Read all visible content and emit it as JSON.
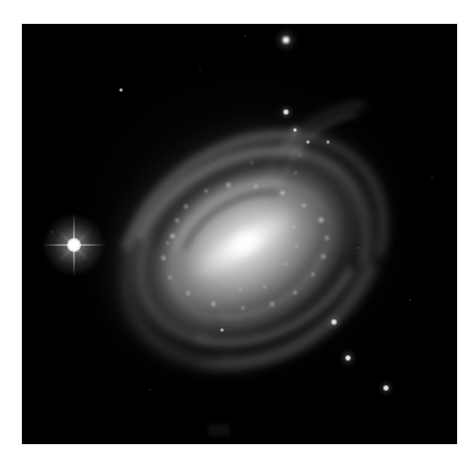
{
  "page": {
    "background_color": "#ffffff",
    "width": 473,
    "height": 463,
    "content_type": "astronomical-photograph"
  },
  "image_frame": {
    "name": "sky-image",
    "left": 22,
    "top": 24,
    "width": 435,
    "height": 420,
    "background_color": "#000000",
    "border_color": "#bfbfbf",
    "alt_text": "Grayscale telescope image of an inclined barred spiral galaxy on a black star field"
  },
  "galaxy": {
    "label": "spiral-galaxy",
    "center_x": 243,
    "center_y": 244,
    "position_angle_deg": -31,
    "nucleus_color": "#ffffff",
    "disk_color": "#9a9a9a",
    "dust_lane_color": "#000000",
    "components": [
      {
        "name": "nucleus",
        "brightness": "saturated-white"
      },
      {
        "name": "bar-bulge",
        "brightness": "very-bright"
      },
      {
        "name": "inner-disk",
        "brightness": "bright"
      },
      {
        "name": "spiral-arms",
        "brightness": "medium"
      },
      {
        "name": "dust-lanes",
        "brightness": "dark"
      },
      {
        "name": "outer-halo",
        "brightness": "faint"
      }
    ],
    "knots": [
      {
        "x": -55,
        "y": -46,
        "r": 3.0,
        "o": 0.8
      },
      {
        "x": -40,
        "y": -62,
        "r": 2.4,
        "o": 0.65
      },
      {
        "x": -22,
        "y": -74,
        "r": 2.6,
        "o": 0.7
      },
      {
        "x": 6,
        "y": -82,
        "r": 2.2,
        "o": 0.62
      },
      {
        "x": 30,
        "y": -78,
        "r": 2.8,
        "o": 0.72
      },
      {
        "x": 52,
        "y": -62,
        "r": 2.4,
        "o": 0.6
      },
      {
        "x": 70,
        "y": -40,
        "r": 3.0,
        "o": 0.75
      },
      {
        "x": 80,
        "y": -14,
        "r": 2.6,
        "o": 0.66
      },
      {
        "x": 84,
        "y": 12,
        "r": 3.2,
        "o": 0.78
      },
      {
        "x": 76,
        "y": 36,
        "r": 2.6,
        "o": 0.64
      },
      {
        "x": 60,
        "y": 56,
        "r": 2.8,
        "o": 0.68
      },
      {
        "x": 38,
        "y": 72,
        "r": 2.4,
        "o": 0.6
      },
      {
        "x": 10,
        "y": 84,
        "r": 2.6,
        "o": 0.64
      },
      {
        "x": -18,
        "y": 86,
        "r": 2.8,
        "o": 0.66
      },
      {
        "x": -46,
        "y": 76,
        "r": 2.4,
        "o": 0.58
      },
      {
        "x": -68,
        "y": 56,
        "r": 3.0,
        "o": 0.7
      },
      {
        "x": -82,
        "y": 30,
        "r": 2.6,
        "o": 0.62
      },
      {
        "x": -86,
        "y": 2,
        "r": 2.4,
        "o": 0.58
      },
      {
        "x": -78,
        "y": -24,
        "r": 2.8,
        "o": 0.66
      },
      {
        "x": -64,
        "y": -40,
        "r": 2.2,
        "o": 0.54
      },
      {
        "x": 44,
        "y": 30,
        "r": 2.0,
        "o": 0.5
      },
      {
        "x": 56,
        "y": 6,
        "r": 2.2,
        "o": 0.55
      },
      {
        "x": -34,
        "y": 52,
        "r": 2.0,
        "o": 0.5
      },
      {
        "x": -12,
        "y": 62,
        "r": 2.2,
        "o": 0.52
      },
      {
        "x": 22,
        "y": 46,
        "r": 1.8,
        "o": 0.46
      },
      {
        "x": -50,
        "y": 12,
        "r": 1.8,
        "o": 0.44
      },
      {
        "x": 96,
        "y": -58,
        "r": 2.0,
        "o": 0.48
      },
      {
        "x": 112,
        "y": -76,
        "r": 1.8,
        "o": 0.44
      },
      {
        "x": 66,
        "y": -92,
        "r": 1.8,
        "o": 0.42
      }
    ]
  },
  "bright_star": {
    "name": "foreground-star-with-diffraction-spikes",
    "x": 74,
    "y": 245,
    "core_radius": 7,
    "color": "#ffffff",
    "has_diffraction_spikes": true
  },
  "field_stars": [
    {
      "name": "star-top-right",
      "x": 286,
      "y": 40,
      "r": 4.0,
      "o": 1.0
    },
    {
      "name": "star-upper-left-faint",
      "x": 121,
      "y": 90,
      "r": 2.2,
      "o": 0.72
    },
    {
      "name": "star-upper-mid",
      "x": 286,
      "y": 112,
      "r": 2.8,
      "o": 0.88
    },
    {
      "name": "star-arm-edge",
      "x": 295,
      "y": 130,
      "r": 2.4,
      "o": 0.8
    },
    {
      "name": "star-in-arm-a",
      "x": 308,
      "y": 142,
      "r": 1.8,
      "o": 0.62
    },
    {
      "name": "star-in-arm-b",
      "x": 328,
      "y": 142,
      "r": 1.6,
      "o": 0.55
    },
    {
      "name": "star-lower-right-a",
      "x": 334,
      "y": 322,
      "r": 2.6,
      "o": 0.86
    },
    {
      "name": "star-lower-right-b",
      "x": 348,
      "y": 358,
      "r": 3.0,
      "o": 0.92
    },
    {
      "name": "star-lower-right-c",
      "x": 386,
      "y": 388,
      "r": 2.8,
      "o": 0.9
    },
    {
      "name": "star-in-disk-low",
      "x": 222,
      "y": 330,
      "r": 1.8,
      "o": 0.6
    },
    {
      "name": "star-faint-right",
      "x": 410,
      "y": 300,
      "r": 1.2,
      "o": 0.26
    },
    {
      "name": "star-faint-upper-right",
      "x": 432,
      "y": 178,
      "r": 1.1,
      "o": 0.22
    },
    {
      "name": "star-faint-top",
      "x": 245,
      "y": 36,
      "r": 1.0,
      "o": 0.18
    },
    {
      "name": "star-faint-left",
      "x": 52,
      "y": 232,
      "r": 1.1,
      "o": 0.22
    },
    {
      "name": "star-faint-mid-right",
      "x": 358,
      "y": 248,
      "r": 1.1,
      "o": 0.24
    },
    {
      "name": "star-faint-lower-left",
      "x": 150,
      "y": 390,
      "r": 1.0,
      "o": 0.18
    },
    {
      "name": "star-faint-upper-mid",
      "x": 200,
      "y": 70,
      "r": 1.0,
      "o": 0.16
    }
  ],
  "faint_artifact": {
    "name": "bottom-edge-faint-marking",
    "x": 208,
    "y": 424,
    "width": 22,
    "height": 12
  }
}
